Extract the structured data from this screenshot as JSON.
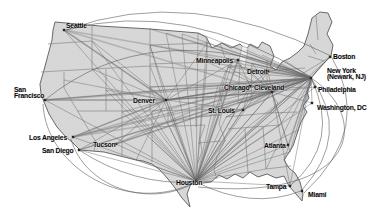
{
  "figure": {
    "kind": "airline-route-map",
    "region": "United States"
  },
  "palette": {
    "background": "#ffffff",
    "land": "#d9d9d9",
    "land_hatch": "#c8c8c8",
    "outline": "#595959",
    "state_line": "#8a8a8a",
    "spoke_route": "#6a6a6a",
    "trunk_route": "#9b9b9b",
    "arc_route": "#5a5a5a",
    "city_dot": "#262626",
    "label": "#050505"
  },
  "geometry": {
    "outline": "M55,22 L100,26 L150,29 L198,33 L206,37 L212,48 L222,43 L231,48 L240,44 L246,50 L250,44 L258,48 L262,42 L270,46 L274,56 L270,66 L276,70 L282,62 L290,58 L298,52 L304,46 L308,34 L312,18 L320,12 L328,13 L332,22 L327,34 L333,45 L331,56 L323,64 L316,72 L311,78 L311,84 L307,92 L309,98 L303,106 L307,112 L301,122 L297,134 L293,146 L288,154 L284,160 L289,168 L295,173 L300,182 L303,194 L302,201 L296,194 L289,186 L284,176 L276,178 L267,174 L258,177 L250,172 L243,178 L235,174 L227,179 L219,175 L211,182 L203,183 L196,180 L190,186 L187,194 L190,207 L182,198 L175,188 L168,179 L160,170 L152,164 L143,161 L136,160 L120,156 L104,152 L92,151 L80,150 L73,143 L65,136 L57,127 L49,114 L44,102 L41,94 L40,84 L44,70 L48,55 L52,40 L53,30 Z",
    "lake": "M242,46 L238,66 L245,68 L248,48 Z",
    "state_borders": [
      "M48,44 L92,41",
      "M92,25 L92,69",
      "M41,72 L92,69",
      "M64,72 L64,88 L90,132",
      "M90,132 L96,142 L94,151",
      "M92,69 L150,66",
      "M106,69 L106,111",
      "M77,111 L150,111",
      "M122,69 L122,157",
      "M150,28 L150,111",
      "M152,111 L152,162",
      "M150,45 L207,43",
      "M150,64 L209,62",
      "M150,87 L218,85",
      "M150,111 L220,109",
      "M152,127 L205,125",
      "M205,125 L200,139 L202,151 L198,163",
      "M168,112 L168,127",
      "M207,37 L207,62",
      "M207,62 L233,59",
      "M220,43 L225,58",
      "M228,67 L242,65",
      "M233,59 L225,73 L219,90 L223,108 L219,124 L225,140 L217,156 L214,170 L217,179",
      "M196,85 L196,127",
      "M196,117 L221,115",
      "M198,143 L221,141",
      "M226,117 L268,113 L297,112",
      "M228,129 L280,125",
      "M245,129 L248,173",
      "M263,127 L266,169",
      "M266,169 L291,166",
      "M240,65 L238,103",
      "M252,63 L251,101",
      "M238,103 L250,101 L262,95 L268,91",
      "M267,60 L267,89",
      "M267,89 L307,87",
      "M267,71 L305,68",
      "M268,91 L278,103 L270,113",
      "M310,44 L316,54",
      "M308,56 L324,61",
      "M316,16 L318,40"
    ]
  },
  "cities": [
    {
      "id": "seattle",
      "label": "Seattle",
      "x": 64,
      "y": 30,
      "lx": 66,
      "ly": 28
    },
    {
      "id": "san-francisco",
      "lines": [
        "San",
        "Francisco"
      ],
      "x": 45,
      "y": 100,
      "lx": 14,
      "ly": 92
    },
    {
      "id": "los-angeles",
      "label": "Los Angeles",
      "x": 73,
      "y": 137,
      "lx": 29,
      "ly": 140
    },
    {
      "id": "san-diego",
      "label": "San Diego",
      "x": 79,
      "y": 150,
      "lx": 42,
      "ly": 153
    },
    {
      "id": "tucson",
      "label": "Tucson",
      "x": 116,
      "y": 144,
      "lx": 93,
      "ly": 147
    },
    {
      "id": "denver",
      "label": "Denver",
      "x": 166,
      "y": 100,
      "lx": 133,
      "ly": 103
    },
    {
      "id": "minneapolis",
      "label": "Minneapolis",
      "x": 238,
      "y": 60,
      "lx": 196,
      "ly": 63
    },
    {
      "id": "chicago",
      "label": "Chicago",
      "x": 250,
      "y": 86,
      "lx": 224,
      "ly": 90
    },
    {
      "id": "cleveland",
      "label": "Cleveland",
      "x": 272,
      "y": 92,
      "lx": 254,
      "ly": 90
    },
    {
      "id": "detroit",
      "label": "Detroit",
      "x": 268,
      "y": 71,
      "lx": 247,
      "ly": 74
    },
    {
      "id": "st-louis",
      "label": "St. Louis",
      "x": 243,
      "y": 110,
      "lx": 208,
      "ly": 113
    },
    {
      "id": "houston",
      "label": "Houston",
      "x": 196,
      "y": 181,
      "lx": 176,
      "ly": 185
    },
    {
      "id": "atlanta",
      "label": "Atlanta",
      "x": 288,
      "y": 145,
      "lx": 264,
      "ly": 148
    },
    {
      "id": "tampa",
      "label": "Tampa",
      "x": 290,
      "y": 186,
      "lx": 266,
      "ly": 189
    },
    {
      "id": "miami",
      "label": "Miami",
      "x": 302,
      "y": 191,
      "lx": 308,
      "ly": 197
    },
    {
      "id": "boston",
      "label": "Boston",
      "x": 330,
      "y": 57,
      "lx": 333,
      "ly": 59
    },
    {
      "id": "new-york",
      "lines": [
        "New York",
        "(Newark, NJ)"
      ],
      "x": 311,
      "y": 78,
      "lx": 327,
      "ly": 73
    },
    {
      "id": "philadelphia",
      "label": "Philadelphia",
      "x": 315,
      "y": 87,
      "lx": 318,
      "ly": 92
    },
    {
      "id": "washington-dc",
      "label": "Washington, DC",
      "x": 312,
      "y": 103,
      "lx": 317,
      "ly": 110
    }
  ],
  "routes": {
    "trunks": [
      [
        "los-angeles",
        "cleveland"
      ],
      [
        "san-diego",
        "new-york"
      ],
      [
        "tucson",
        "chicago"
      ],
      [
        "san-francisco",
        "new-york"
      ],
      [
        "san-francisco",
        "chicago"
      ],
      [
        "seattle",
        "denver"
      ],
      [
        "seattle",
        "chicago"
      ],
      [
        "los-angeles",
        "denver"
      ],
      [
        "denver",
        "new-york"
      ],
      [
        "denver",
        "cleveland"
      ],
      [
        "los-angeles",
        "chicago"
      ],
      [
        "tucson",
        "cleveland"
      ],
      [
        "san-francisco",
        "denver"
      ],
      [
        "minneapolis",
        "houston"
      ],
      [
        "los-angeles",
        "st-louis"
      ],
      [
        "seattle",
        "minneapolis"
      ]
    ],
    "spokes": [
      {
        "hub": "houston",
        "targets": [
          "seattle",
          "san-francisco",
          "los-angeles",
          "san-diego",
          "tucson",
          "denver",
          "minneapolis",
          "chicago",
          "detroit",
          "cleveland",
          "st-louis",
          "new-york",
          "boston",
          "philadelphia",
          "washington-dc",
          "atlanta",
          "tampa"
        ],
        "fan": [
          [
            136,
            160
          ],
          [
            150,
            112
          ],
          [
            150,
            88
          ],
          [
            150,
            46
          ],
          [
            122,
            112
          ],
          [
            106,
            90
          ],
          [
            92,
            69
          ],
          [
            92,
            41
          ],
          [
            150,
            66
          ],
          [
            166,
            33
          ],
          [
            182,
            34
          ],
          [
            198,
            33
          ],
          [
            207,
            43
          ],
          [
            207,
            62
          ],
          [
            218,
            85
          ],
          [
            220,
            109
          ],
          [
            226,
            140
          ],
          [
            233,
            59
          ],
          [
            228,
            67
          ],
          [
            240,
            103
          ],
          [
            252,
            100
          ],
          [
            263,
            127
          ],
          [
            245,
            129
          ],
          [
            226,
            117
          ],
          [
            268,
            113
          ],
          [
            280,
            125
          ],
          [
            266,
            169
          ],
          [
            290,
            152
          ],
          [
            298,
            130
          ],
          [
            170,
            128
          ],
          [
            152,
            140
          ],
          [
            213,
            181
          ]
        ]
      },
      {
        "hub": "new-york",
        "targets": [
          "san-francisco",
          "los-angeles",
          "san-diego",
          "tucson",
          "denver",
          "minneapolis",
          "chicago",
          "detroit",
          "cleveland",
          "st-louis",
          "houston",
          "atlanta",
          "washington-dc",
          "boston",
          "philadelphia",
          "tampa"
        ],
        "fan": [
          [
            150,
            29
          ],
          [
            166,
            33
          ],
          [
            182,
            34
          ],
          [
            198,
            33
          ],
          [
            207,
            43
          ],
          [
            150,
            45
          ],
          [
            150,
            66
          ],
          [
            207,
            62
          ],
          [
            218,
            85
          ],
          [
            233,
            59
          ],
          [
            219,
            90
          ],
          [
            226,
            117
          ],
          [
            240,
            103
          ],
          [
            252,
            63
          ],
          [
            262,
            55
          ],
          [
            284,
            60
          ],
          [
            268,
            113
          ],
          [
            280,
            125
          ],
          [
            290,
            152
          ],
          [
            266,
            169
          ],
          [
            252,
            100
          ],
          [
            245,
            129
          ],
          [
            228,
            67
          ],
          [
            246,
            50
          ],
          [
            222,
            43
          ],
          [
            150,
            87
          ],
          [
            152,
            111
          ],
          [
            297,
            134
          ],
          [
            284,
            160
          ]
        ]
      },
      {
        "hub": "cleveland",
        "targets": [
          "minneapolis",
          "chicago",
          "detroit",
          "st-louis",
          "denver",
          "boston",
          "new-york",
          "philadelphia",
          "washington-dc",
          "atlanta",
          "tampa",
          "houston"
        ],
        "fan": [
          [
            226,
            117
          ],
          [
            240,
            103
          ],
          [
            252,
            63
          ],
          [
            207,
            62
          ],
          [
            233,
            59
          ],
          [
            219,
            90
          ],
          [
            228,
            67
          ],
          [
            290,
            152
          ]
        ]
      },
      {
        "hub": "denver",
        "targets": [
          "seattle",
          "san-francisco",
          "los-angeles",
          "san-diego",
          "tucson",
          "minneapolis",
          "chicago",
          "st-louis",
          "houston",
          "cleveland",
          "new-york"
        ],
        "fan": [
          [
            92,
            41
          ],
          [
            92,
            69
          ],
          [
            64,
            80
          ],
          [
            106,
            90
          ],
          [
            122,
            112
          ],
          [
            136,
            160
          ],
          [
            150,
            45
          ],
          [
            207,
            43
          ]
        ]
      },
      {
        "hub": "chicago",
        "targets": [
          "minneapolis",
          "detroit",
          "st-louis"
        ],
        "fan": []
      }
    ],
    "arcs": [
      "M66,30 Q190,-16 331,56",
      "M66,30 Q185,-2 311,77",
      "M45,100 Q150,14 311,77",
      "M311,78 Q352,134 302,190",
      "M331,56 Q374,128 304,193",
      "M311,78 Q342,142 290,186",
      "M311,78 C372,118 358,202 198,187",
      "M196,182 Q252,210 301,191",
      "M196,182 C148,210 84,186 71,139",
      "M196,182 C128,216 46,168 43,104",
      "M79,150 Q134,186 195,182"
    ]
  }
}
